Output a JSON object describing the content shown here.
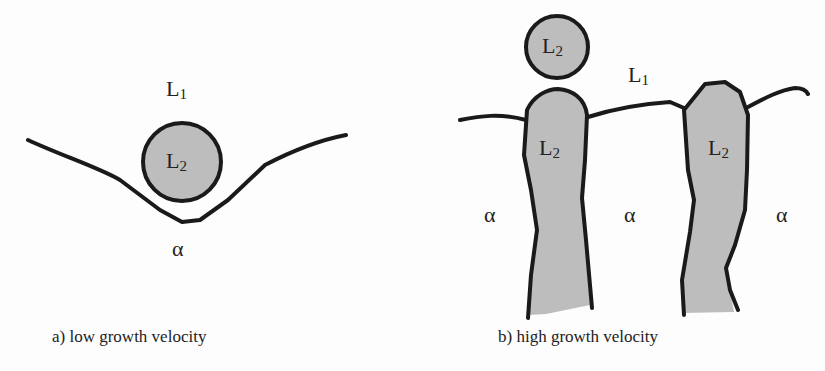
{
  "panels": [
    {
      "id": "a",
      "caption": "a) low growth velocity",
      "labels": {
        "liquid1": "L",
        "liquid1_sub": "1",
        "droplet": "L",
        "droplet_sub": "2",
        "solid": "α"
      }
    },
    {
      "id": "b",
      "caption": "b) high growth velocity",
      "labels": {
        "liquid1": "L",
        "liquid1_sub": "1",
        "droplet": "L",
        "droplet_sub": "2",
        "column1": "L",
        "column1_sub": "2",
        "column2": "L",
        "column2_sub": "2",
        "solid_left": "α",
        "solid_mid": "α",
        "solid_right": "α"
      }
    }
  ],
  "colors": {
    "fill": "#bdbdbd",
    "stroke": "#1a1a1a"
  }
}
